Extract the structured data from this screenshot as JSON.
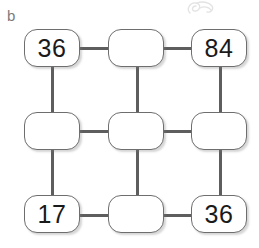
{
  "figure": {
    "part_label": "b",
    "artifact": "scan-smudge"
  },
  "colors": {
    "box_border": "#6e6e6e",
    "connector": "#5e5e5e",
    "value_text": "#1a1a1a",
    "label_text": "#7b7b7b",
    "background": "#ffffff"
  },
  "puzzle": {
    "type": "number-grid-puzzle",
    "rows": 3,
    "columns": 3,
    "cells": [
      {
        "id": "r1c1",
        "row": 1,
        "col": 1,
        "value": "36",
        "filled": true
      },
      {
        "id": "r1c2",
        "row": 1,
        "col": 2,
        "value": "",
        "filled": false
      },
      {
        "id": "r1c3",
        "row": 1,
        "col": 3,
        "value": "84",
        "filled": true
      },
      {
        "id": "r2c1",
        "row": 2,
        "col": 1,
        "value": "",
        "filled": false
      },
      {
        "id": "r2c2",
        "row": 2,
        "col": 2,
        "value": "",
        "filled": false
      },
      {
        "id": "r2c3",
        "row": 2,
        "col": 3,
        "value": "",
        "filled": false
      },
      {
        "id": "r3c1",
        "row": 3,
        "col": 1,
        "value": "17",
        "filled": true
      },
      {
        "id": "r3c2",
        "row": 3,
        "col": 2,
        "value": "",
        "filled": false
      },
      {
        "id": "r3c3",
        "row": 3,
        "col": 3,
        "value": "36",
        "filled": true
      }
    ]
  }
}
